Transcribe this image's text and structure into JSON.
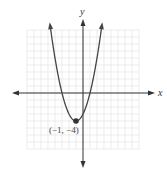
{
  "chart_data": {
    "type": "line",
    "title": "",
    "function": "y = (x + 1)^2 - 4",
    "xlabel": "x",
    "ylabel": "y",
    "xlim": [
      -8,
      8
    ],
    "ylim": [
      -8,
      9
    ],
    "grid": true,
    "series": [
      {
        "name": "parabola",
        "x": [
          -4.7,
          -4,
          -3,
          -2,
          -1,
          0,
          1,
          2,
          2.7
        ],
        "y": [
          9.69,
          5,
          0,
          -3,
          -4,
          -3,
          0,
          5,
          9.69
        ]
      }
    ],
    "annotations": [
      {
        "label": "(−1, −4)",
        "x": -1,
        "y": -4,
        "type": "vertex-point"
      }
    ],
    "x_intercepts": [
      -3,
      1
    ],
    "vertex": [
      -1,
      -4
    ]
  },
  "labels": {
    "x_axis": "x",
    "y_axis": "y",
    "vertex": "(−1, −4)"
  },
  "colors": {
    "curve": "#444444",
    "axes": "#333333",
    "grid": "#e4e4e4",
    "point": "#333333"
  }
}
